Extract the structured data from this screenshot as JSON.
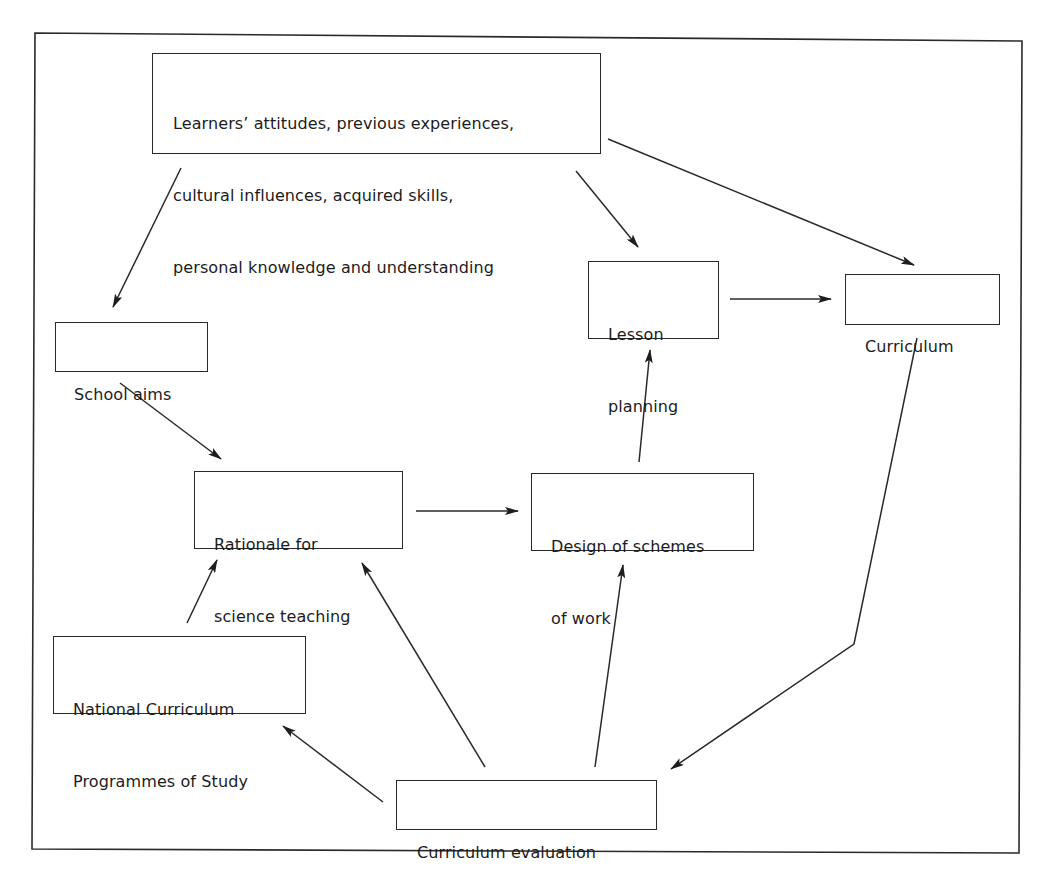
{
  "diagram": {
    "type": "flow-diagram",
    "frame": {
      "stroke": "#2a2a2a"
    },
    "nodes": {
      "learners": {
        "label_lines": [
          "Learners’ attitudes, previous experiences,",
          "cultural influences, acquired skills,",
          "personal knowledge and understanding"
        ]
      },
      "school_aims": {
        "label_lines": [
          "School aims"
        ]
      },
      "lesson_planning": {
        "label_lines": [
          "Lesson",
          "planning"
        ]
      },
      "curriculum": {
        "label_lines": [
          "Curriculum"
        ]
      },
      "rationale": {
        "label_lines": [
          "Rationale for",
          "science teaching"
        ]
      },
      "design": {
        "label_lines": [
          "Design of schemes",
          "of work"
        ]
      },
      "national_curriculum": {
        "label_lines": [
          "National Curriculum",
          "Programmes of Study"
        ]
      },
      "evaluation": {
        "label_lines": [
          "Curriculum evaluation"
        ]
      }
    },
    "edges": [
      {
        "from": "Learners’ attitudes…",
        "to": "School aims"
      },
      {
        "from": "Learners’ attitudes…",
        "to": "Lesson planning"
      },
      {
        "from": "Learners’ attitudes…",
        "to": "Curriculum"
      },
      {
        "from": "Lesson planning",
        "to": "Curriculum"
      },
      {
        "from": "School aims",
        "to": "Rationale for science teaching"
      },
      {
        "from": "Rationale for science teaching",
        "to": "Design of schemes of work"
      },
      {
        "from": "Design of schemes of work",
        "to": "Lesson planning"
      },
      {
        "from": "National Curriculum Programmes of Study",
        "to": "Rationale for science teaching"
      },
      {
        "from": "Curriculum evaluation",
        "to": "National Curriculum Programmes of Study"
      },
      {
        "from": "Curriculum evaluation",
        "to": "Rationale for science teaching"
      },
      {
        "from": "Curriculum evaluation",
        "to": "Design of schemes of work"
      },
      {
        "from": "Curriculum",
        "to": "Curriculum evaluation"
      }
    ]
  }
}
